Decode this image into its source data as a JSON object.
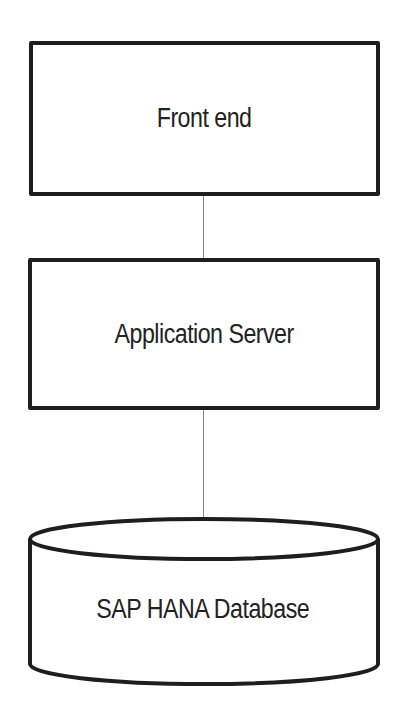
{
  "diagram": {
    "type": "architecture-stack",
    "nodes": [
      {
        "id": "front-end",
        "label": "Front end",
        "shape": "rectangle"
      },
      {
        "id": "app-server",
        "label": "Application Server",
        "shape": "rectangle"
      },
      {
        "id": "database",
        "label": "SAP HANA Database",
        "shape": "cylinder"
      }
    ],
    "edges": [
      {
        "from": "front-end",
        "to": "app-server"
      },
      {
        "from": "app-server",
        "to": "database"
      }
    ],
    "colors": {
      "stroke": "#1e1e1e",
      "connector": "#8a8a8a",
      "background": "#ffffff"
    }
  }
}
